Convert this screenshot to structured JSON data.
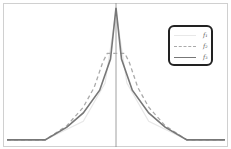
{
  "chart_data": {
    "type": "line",
    "title": "",
    "xlabel": "",
    "ylabel": "",
    "grid": false,
    "legend_position": "upper right",
    "xlim": [
      -1,
      1
    ],
    "ylim": [
      0,
      1
    ],
    "axes": {
      "vertical_axis_at_x": 0,
      "tick_labels": "none"
    },
    "series": [
      {
        "name": "f₁",
        "style": "solid",
        "color": "#e8e8e8",
        "description": "very faint, barely visible",
        "x": [
          -1,
          -0.65,
          -0.3,
          -0.1,
          0,
          0.1,
          0.3,
          0.65,
          1
        ],
        "y": [
          0.05,
          0.05,
          0.18,
          0.45,
          0.95,
          0.45,
          0.18,
          0.05,
          0.05
        ]
      },
      {
        "name": "f₂",
        "style": "dashed",
        "color": "#aaaaaa",
        "x": [
          -1,
          -0.65,
          -0.45,
          -0.3,
          -0.2,
          -0.12,
          -0.08,
          0,
          0.08,
          0.12,
          0.2,
          0.3,
          0.45,
          0.65,
          1
        ],
        "y": [
          0.05,
          0.05,
          0.15,
          0.28,
          0.42,
          0.6,
          0.66,
          0.66,
          0.66,
          0.6,
          0.42,
          0.28,
          0.15,
          0.05,
          0.05
        ]
      },
      {
        "name": "f₃",
        "style": "solid",
        "color": "#777777",
        "x": [
          -1,
          -0.65,
          -0.45,
          -0.3,
          -0.15,
          -0.05,
          0,
          0.05,
          0.15,
          0.3,
          0.45,
          0.65,
          1
        ],
        "y": [
          0.05,
          0.05,
          0.14,
          0.24,
          0.4,
          0.62,
          0.98,
          0.62,
          0.4,
          0.24,
          0.14,
          0.05,
          0.05
        ]
      }
    ]
  },
  "legend": {
    "items": [
      {
        "label": "f₁",
        "style": "solid",
        "color": "#e8e8e8"
      },
      {
        "label": "f₂",
        "style": "dashed",
        "color": "#aaaaaa"
      },
      {
        "label": "f₃",
        "style": "solid",
        "color": "#777777"
      }
    ]
  },
  "colors": {
    "frame": "#d0d0d0",
    "axis": "#888888",
    "legend_border": "#222222"
  }
}
